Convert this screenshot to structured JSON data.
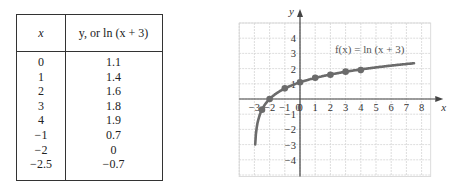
{
  "table": {
    "headers": {
      "x": "x",
      "y": "y, or ln (x + 3)"
    },
    "rows": [
      {
        "x": "0",
        "y": "1.1"
      },
      {
        "x": "1",
        "y": "1.4"
      },
      {
        "x": "2",
        "y": "1.6"
      },
      {
        "x": "3",
        "y": "1.8"
      },
      {
        "x": "4",
        "y": "1.9"
      },
      {
        "x": "−1",
        "y": "0.7"
      },
      {
        "x": "−2",
        "y": "0"
      },
      {
        "x": "−2.5",
        "y": "−0.7"
      }
    ]
  },
  "graph": {
    "label": "f(x) = ln (x + 3)",
    "xlabel": "x",
    "ylabel": "y"
  },
  "chart_data": {
    "type": "line",
    "title": "f(x) = ln (x + 3)",
    "xlabel": "x",
    "ylabel": "y",
    "xlim": [
      -4,
      9
    ],
    "ylim": [
      -5,
      5
    ],
    "grid": true,
    "x_ticks": [
      -3,
      -2,
      -1,
      0,
      1,
      2,
      3,
      4,
      5,
      6,
      7,
      8
    ],
    "y_ticks": [
      -4,
      -3,
      -2,
      -1,
      1,
      2,
      3,
      4
    ],
    "series": [
      {
        "name": "f(x) = ln (x + 3)",
        "points": [
          {
            "x": -2.5,
            "y": -0.7
          },
          {
            "x": -2,
            "y": 0
          },
          {
            "x": -1,
            "y": 0.7
          },
          {
            "x": 0,
            "y": 1.1
          },
          {
            "x": 1,
            "y": 1.4
          },
          {
            "x": 2,
            "y": 1.6
          },
          {
            "x": 3,
            "y": 1.8
          },
          {
            "x": 4,
            "y": 1.9
          }
        ]
      }
    ]
  }
}
